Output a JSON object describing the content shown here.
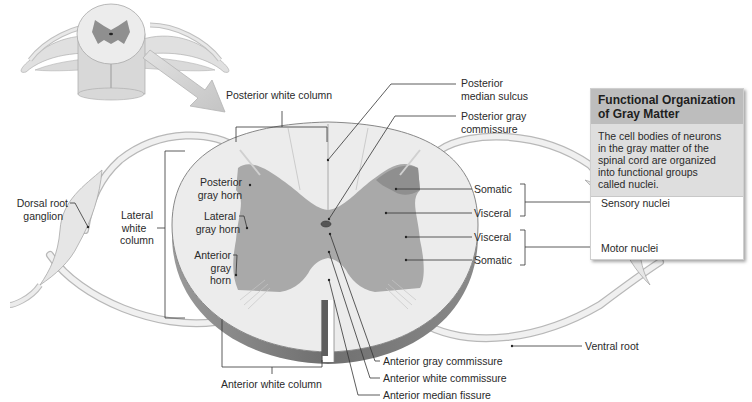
{
  "figure": {
    "overview_thumbnail": "spinal cord segment with spinal nerves (3D overview)",
    "callout_arrow": "magnify-arrow"
  },
  "labels": {
    "posterior_white_column": "Posterior white column",
    "posterior_median_sulcus_1": "Posterior",
    "posterior_median_sulcus_2": "median sulcus",
    "posterior_gray_commissure_1": "Posterior gray",
    "posterior_gray_commissure_2": "commissure",
    "dorsal_root_ganglion_1": "Dorsal root",
    "dorsal_root_ganglion_2": "ganglion",
    "lateral_white_column_1": "Lateral",
    "lateral_white_column_2": "white",
    "lateral_white_column_3": "column",
    "posterior_gray_horn_1": "Posterior",
    "posterior_gray_horn_2": "gray horn",
    "lateral_gray_horn_1": "Lateral",
    "lateral_gray_horn_2": "gray horn",
    "anterior_gray_horn_1": "Anterior",
    "anterior_gray_horn_2": "gray",
    "anterior_gray_horn_3": "horn",
    "somatic_sensory": "Somatic",
    "visceral_sensory": "Visceral",
    "visceral_motor": "Visceral",
    "somatic_motor": "Somatic",
    "ventral_root": "Ventral root",
    "anterior_white_column": "Anterior white column",
    "anterior_gray_commissure": "Anterior gray commissure",
    "anterior_white_commissure": "Anterior white commissure",
    "anterior_median_fissure": "Anterior median fissure"
  },
  "info_box": {
    "title_1": "Functional Organization",
    "title_2": "of Gray Matter",
    "body_1": "The cell bodies of neurons",
    "body_2": "in the gray matter of the",
    "body_3": "spinal cord are organized",
    "body_4": "into functional groups",
    "body_5": "called nuclei.",
    "sensory_nuclei": "Sensory nuclei",
    "motor_nuclei": "Motor nuclei"
  },
  "colors": {
    "white_matter": "#ececec",
    "gray_matter": "#a9a9a9",
    "somatic_sensory": "#8f8f8f",
    "visceral": "#a2a2a2",
    "cord_edge": "#7a7a7a",
    "nerve": "#e6e6e6",
    "leader_line": "#333333",
    "box_header": "#bdbdbd",
    "box_body": "#dedede"
  }
}
